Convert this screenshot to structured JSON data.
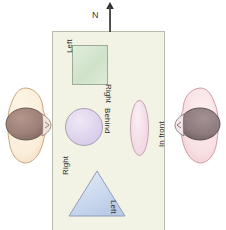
{
  "diagram": {
    "compass": {
      "label": "N",
      "icon": "north-arrow-icon"
    },
    "table": {
      "name": "table-surface",
      "fill": "#f2f3e4",
      "stroke": "#b9bbae"
    },
    "objects": [
      {
        "id": "square",
        "shape": "square",
        "fill": "#d5e6cf",
        "stroke": "#9aab96",
        "labels": {
          "left": "Left",
          "right": "Right"
        }
      },
      {
        "id": "circle",
        "shape": "circle",
        "fill": "#ddd2ec",
        "stroke": "#a99fb9",
        "labels": {
          "left": "",
          "right": "Behind"
        }
      },
      {
        "id": "ellipse",
        "shape": "ellipse",
        "fill": "#f3dbe6",
        "stroke": "#c2a5b2",
        "labels": {
          "left": "",
          "right": "In front"
        }
      },
      {
        "id": "triangle",
        "shape": "triangle",
        "fill": "#c5d3ea",
        "stroke": "#8f9dba",
        "labels": {
          "left": "Right",
          "right": "Left"
        }
      }
    ],
    "labels": {
      "square_left": "Left",
      "square_right": "Right",
      "behind": "Behind",
      "in_front": "In front",
      "triangle_right": "Right",
      "triangle_left": "Left"
    },
    "observers": [
      {
        "id": "observer-left",
        "facing": "right",
        "body_fill": "#fbeeda",
        "body_stroke": "#caa97f",
        "head_fill": "#9d8078",
        "head_stroke": "#6e5a54"
      },
      {
        "id": "observer-right",
        "facing": "left",
        "body_fill": "#f8dfe2",
        "body_stroke": "#cf9ea6",
        "head_fill": "#8d7b7d",
        "head_stroke": "#5f5355"
      }
    ]
  }
}
